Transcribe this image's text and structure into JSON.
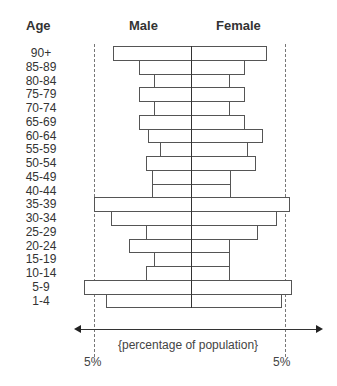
{
  "chart_data": {
    "type": "bar",
    "subtype": "population-pyramid",
    "title": "",
    "headers": {
      "age": "Age",
      "male": "Male",
      "female": "Female"
    },
    "xlabel": "{percentage of population}",
    "ylabel": "Age",
    "x_ticks": [
      "5%",
      "5%"
    ],
    "xlim": [
      -5,
      5
    ],
    "grid": false,
    "legend": null,
    "categories": [
      "90+",
      "85-89",
      "80-84",
      "75-79",
      "70-74",
      "65-69",
      "60-64",
      "55-59",
      "50-54",
      "45-49",
      "40-44",
      "35-39",
      "30-34",
      "25-29",
      "20-24",
      "15-19",
      "10-14",
      "5-9",
      "1-4"
    ],
    "series": [
      {
        "name": "Male",
        "values": [
          4.0,
          2.7,
          1.9,
          2.7,
          1.9,
          2.7,
          2.2,
          1.6,
          2.3,
          2.0,
          2.0,
          5.0,
          4.1,
          2.3,
          3.2,
          1.9,
          2.3,
          5.5,
          4.4
        ]
      },
      {
        "name": "Female",
        "values": [
          4.0,
          2.8,
          2.0,
          2.8,
          2.0,
          2.8,
          3.8,
          3.0,
          3.4,
          2.1,
          2.1,
          5.2,
          4.5,
          3.5,
          2.0,
          2.0,
          2.0,
          5.3,
          4.8
        ]
      }
    ]
  }
}
